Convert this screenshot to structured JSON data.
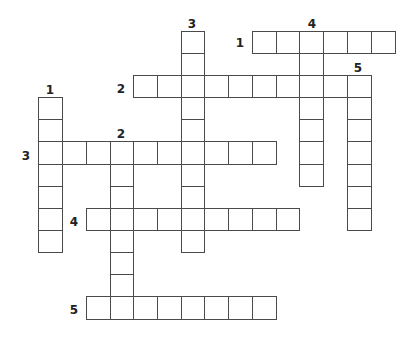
{
  "puzzle": {
    "type": "crossword",
    "grid": {
      "origin_x": 38,
      "origin_y": 31,
      "col_lefts": [
        38,
        62,
        86,
        110,
        133,
        157,
        181,
        204,
        228,
        252,
        276,
        299,
        323,
        347,
        371
      ],
      "row_tops": [
        31,
        53,
        75,
        97,
        119,
        141,
        164,
        186,
        208,
        230,
        252,
        274,
        296
      ],
      "cell_w": 24,
      "cell_h": 23
    },
    "across": [
      {
        "number": "1",
        "row": 0,
        "col": 9,
        "length": 6,
        "label_x": 240,
        "label_y": 43
      },
      {
        "number": "2",
        "row": 2,
        "col": 4,
        "length": 10,
        "label_x": 121,
        "label_y": 89
      },
      {
        "number": "3",
        "row": 5,
        "col": 0,
        "length": 10,
        "label_x": 26,
        "label_y": 156
      },
      {
        "number": "4",
        "row": 8,
        "col": 2,
        "length": 9,
        "label_x": 74,
        "label_y": 222
      },
      {
        "number": "5",
        "row": 12,
        "col": 2,
        "length": 8,
        "label_x": 74,
        "label_y": 310
      }
    ],
    "down": [
      {
        "number": "1",
        "row": 3,
        "col": 0,
        "length": 7,
        "label_x": 50,
        "label_y": 90
      },
      {
        "number": "2",
        "row": 5,
        "col": 3,
        "length": 8,
        "label_x": 121,
        "label_y": 134
      },
      {
        "number": "3",
        "row": 0,
        "col": 6,
        "length": 10,
        "label_x": 192,
        "label_y": 24
      },
      {
        "number": "4",
        "row": 0,
        "col": 11,
        "length": 7,
        "label_x": 312,
        "label_y": 24
      },
      {
        "number": "5",
        "row": 2,
        "col": 13,
        "length": 7,
        "label_x": 358,
        "label_y": 68
      }
    ]
  }
}
